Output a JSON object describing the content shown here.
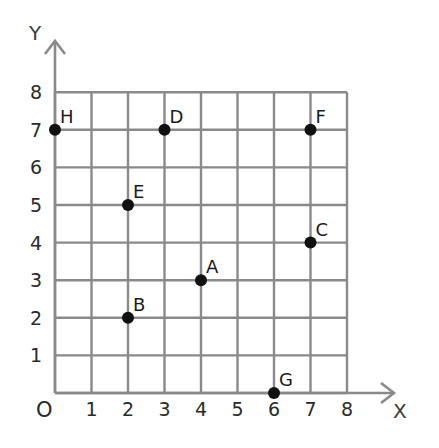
{
  "chart_data": {
    "type": "scatter",
    "title": "",
    "xlabel": "X",
    "ylabel": "Y",
    "origin_label": "O",
    "xlim": [
      0,
      8
    ],
    "ylim": [
      0,
      8
    ],
    "grid": true,
    "x_ticks": [
      "1",
      "2",
      "3",
      "4",
      "5",
      "6",
      "7",
      "8"
    ],
    "y_ticks": [
      "1",
      "2",
      "3",
      "4",
      "5",
      "6",
      "7",
      "8"
    ],
    "points": [
      {
        "label": "A",
        "x": 4,
        "y": 3
      },
      {
        "label": "B",
        "x": 2,
        "y": 2
      },
      {
        "label": "C",
        "x": 7,
        "y": 4
      },
      {
        "label": "D",
        "x": 3,
        "y": 7
      },
      {
        "label": "E",
        "x": 2,
        "y": 5
      },
      {
        "label": "F",
        "x": 7,
        "y": 7
      },
      {
        "label": "G",
        "x": 6,
        "y": 0
      },
      {
        "label": "H",
        "x": 0,
        "y": 7
      }
    ],
    "colors": {
      "grid": "#8a8a8a",
      "point": "#111111",
      "text": "#2a2a2a"
    }
  }
}
